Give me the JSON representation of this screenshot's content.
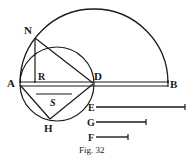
{
  "figure": {
    "caption": "Fig. 32",
    "points": {
      "A": "A",
      "R": "R",
      "D": "D",
      "B": "B",
      "N": "N",
      "H": "H",
      "S": "S",
      "E": "E",
      "G": "G",
      "F": "F"
    }
  },
  "colors": {
    "ink": "#1a1a1a",
    "background": "#ffffff"
  }
}
